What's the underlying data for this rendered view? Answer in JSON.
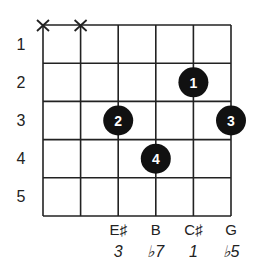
{
  "diagram": {
    "type": "guitar-chord-chart",
    "strings": 6,
    "frets_shown": 5,
    "fret_numbers": [
      "1",
      "2",
      "3",
      "4",
      "5"
    ],
    "muted_strings": [
      1,
      2
    ],
    "muted_symbol": "X",
    "fingers": [
      {
        "string": 5,
        "fret": 2,
        "finger": "1"
      },
      {
        "string": 3,
        "fret": 3,
        "finger": "2"
      },
      {
        "string": 6,
        "fret": 3,
        "finger": "3"
      },
      {
        "string": 4,
        "fret": 4,
        "finger": "4"
      }
    ],
    "note_labels": [
      {
        "string": 3,
        "note": "E♯",
        "degree": "3"
      },
      {
        "string": 4,
        "note": "B",
        "degree": "♭7"
      },
      {
        "string": 5,
        "note": "C♯",
        "degree": "1"
      },
      {
        "string": 6,
        "note": "G",
        "degree": "♭5"
      }
    ],
    "colors": {
      "grid": "#222222",
      "dot": "#111111",
      "dot_text": "#ffffff"
    }
  }
}
